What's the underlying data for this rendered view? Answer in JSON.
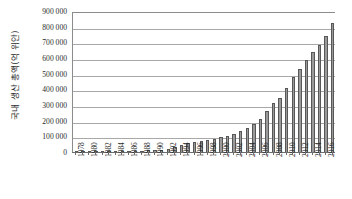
{
  "chart_data": {
    "type": "bar",
    "title": "",
    "xlabel": "",
    "ylabel": "국내 생산 총액(억 위안)",
    "ylim": [
      0,
      900000
    ],
    "ytick_step": 100000,
    "grid": true,
    "legend": false,
    "ytick_labels": [
      "900 000",
      "800 000",
      "700 000",
      "600 000",
      "500 000",
      "400 000",
      "300 000",
      "200 000",
      "100 000",
      "0"
    ],
    "ytick_values": [
      900000,
      800000,
      700000,
      600000,
      500000,
      400000,
      300000,
      200000,
      100000,
      0
    ],
    "xtick_labels": [
      "1978",
      "1980",
      "1982",
      "1984",
      "1986",
      "1988",
      "1990",
      "1992",
      "1994",
      "1996",
      "1998",
      "2000",
      "2002",
      "2004",
      "2006",
      "2008",
      "2010",
      "2012",
      "2014",
      "2016"
    ],
    "categories": [
      "1978",
      "1979",
      "1980",
      "1981",
      "1982",
      "1983",
      "1984",
      "1985",
      "1986",
      "1987",
      "1988",
      "1989",
      "1990",
      "1991",
      "1992",
      "1993",
      "1994",
      "1995",
      "1996",
      "1997",
      "1998",
      "1999",
      "2000",
      "2001",
      "2002",
      "2003",
      "2004",
      "2005",
      "2006",
      "2007",
      "2008",
      "2009",
      "2010",
      "2011",
      "2012",
      "2013",
      "2014",
      "2015",
      "2016",
      "2017"
    ],
    "values": [
      3679,
      4101,
      4588,
      4936,
      5373,
      6021,
      7279,
      9099,
      10377,
      12175,
      15181,
      17180,
      18873,
      22006,
      27195,
      35674,
      48638,
      61340,
      71814,
      79715,
      85196,
      90564,
      100280,
      110863,
      121717,
      137422,
      161840,
      187319,
      219439,
      270092,
      319245,
      348518,
      412119,
      487940,
      538580,
      592963,
      643563,
      688858,
      746395,
      832036
    ],
    "bar_color": "#9a9a9a",
    "bar_edge_color": "#575757",
    "grid_color": "#a8a8a8",
    "axis_color": "#6e6e6e",
    "background": "#ffffff"
  }
}
